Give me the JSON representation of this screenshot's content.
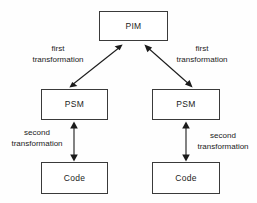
{
  "diagram": {
    "background_color": "#fefefe",
    "line_color": "#1b1b1b",
    "box_border_color": "#3a3a3a",
    "box_fill_color": "#ffffff",
    "nodes": [
      {
        "id": "pim",
        "label": "PIM",
        "x": 99,
        "y": 11,
        "width": 69,
        "height": 30
      },
      {
        "id": "psm_left",
        "label": "PSM",
        "x": 41,
        "y": 89,
        "width": 67,
        "height": 31
      },
      {
        "id": "psm_right",
        "label": "PSM",
        "x": 152,
        "y": 89,
        "width": 68,
        "height": 31
      },
      {
        "id": "code_left",
        "label": "Code",
        "x": 41,
        "y": 162,
        "width": 67,
        "height": 32
      },
      {
        "id": "code_right",
        "label": "Code",
        "x": 152,
        "y": 162,
        "width": 68,
        "height": 32
      }
    ],
    "edges": [
      {
        "id": "pim-psm-left",
        "from": "pim",
        "to": "psm_left",
        "style": "double-headed-diagonal",
        "label_line1": "first",
        "label_line2": "transformation"
      },
      {
        "id": "pim-psm-right",
        "from": "pim",
        "to": "psm_right",
        "style": "double-headed-diagonal",
        "label_line1": "first",
        "label_line2": "transformation"
      },
      {
        "id": "psm-code-left",
        "from": "psm_left",
        "to": "code_left",
        "style": "double-headed-vertical",
        "label_line1": "second",
        "label_line2": "transformation"
      },
      {
        "id": "psm-code-right",
        "from": "psm_right",
        "to": "code_right",
        "style": "double-headed-vertical",
        "label_line1": "second",
        "label_line2": "transformation"
      }
    ]
  }
}
